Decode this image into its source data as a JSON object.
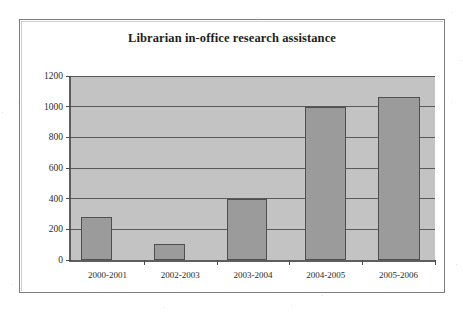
{
  "chart_data": {
    "type": "bar",
    "title": "Librarian in-office research assistance",
    "xlabel": "",
    "ylabel": "",
    "categories": [
      "2000-2001",
      "2002-2003",
      "2003-2004",
      "2004-2005",
      "2005-2006"
    ],
    "values": [
      280,
      105,
      400,
      995,
      1060
    ],
    "series": [
      {
        "name": "Librarian in-office research assistance",
        "values": [
          280,
          105,
          400,
          995,
          1060
        ]
      }
    ],
    "ylim": [
      0,
      1200
    ],
    "yticks": [
      0,
      200,
      400,
      600,
      800,
      1000,
      1200
    ],
    "ytick_labels": [
      "0",
      "200",
      "400",
      "600",
      "800",
      "1000",
      "1200"
    ],
    "grid": true,
    "legend": false,
    "legend_position": "none",
    "colors": {
      "bar_fill": "#9b9b9b",
      "bar_border": "#4f4f4f",
      "plot_background": "#c3c3c3",
      "gridline": "#595959",
      "axis": "#5e5e5e",
      "text": "#2b2b2b",
      "title_text": "#231f20",
      "frame_border": "#7d7d7d",
      "page_background": "#ffffff"
    }
  }
}
